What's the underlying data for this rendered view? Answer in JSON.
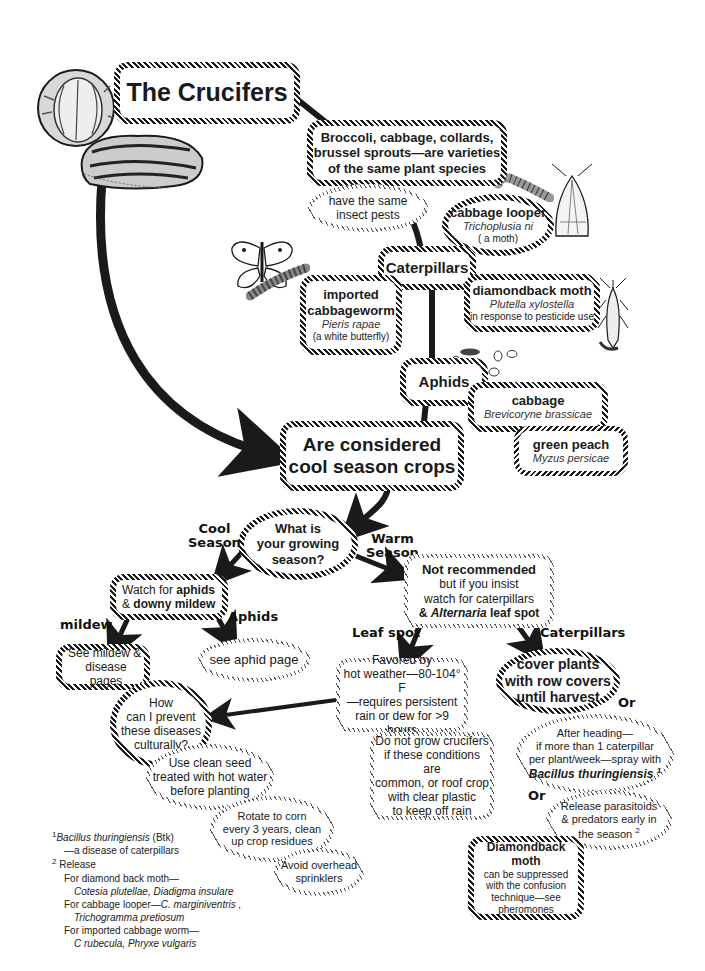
{
  "title": "The Crucifers",
  "nodes": {
    "varieties": "Broccoli, cabbage, collards, brussel sprouts—are varieties of the same plant species",
    "varieties_lines": [
      "Broccoli, cabbage, collards,",
      "brussel sprouts—are varieties",
      "of the same plant species"
    ],
    "same_pests": [
      "have the same",
      "insect pests"
    ],
    "caterpillars": "Caterpillars",
    "cabbage_looper": {
      "name": "cabbage looper",
      "sci": "Trichoplusia ni",
      "note": "( a moth)"
    },
    "imported_cabbageworm": {
      "name_lines": [
        "imported",
        "cabbageworm"
      ],
      "sci": "Pieris rapae",
      "note": "(a white butterfly)"
    },
    "diamondback_moth": {
      "name": "diamondback moth",
      "sci": "Plutella xylostella",
      "note": "in response to pesticide use"
    },
    "aphids": "Aphids",
    "cabbage_aphid": {
      "name": "cabbage",
      "sci": "Brevicoryne brassicae"
    },
    "green_peach": {
      "name": "green peach",
      "sci": "Myzus persicae"
    },
    "cool_season_crops": [
      "Are considered",
      "cool season crops"
    ],
    "growing_season": [
      "What is",
      "your growing",
      "season?"
    ],
    "watch_aphids": {
      "prefix1": "Watch for ",
      "bold1": "aphids",
      "prefix2": "& ",
      "bold2": "downy mildew"
    },
    "not_recommended": {
      "title": "Not recommended",
      "line2": "but if you insist",
      "line3": "watch for caterpillars",
      "prefix4": "& ",
      "ital4": "Alternaria",
      "suffix4": " leaf spot"
    },
    "see_mildew": [
      "See mildew &",
      "disease pages"
    ],
    "see_aphid": "see aphid page",
    "prevent_culturally": [
      "How",
      "can I prevent",
      "these diseases",
      "culturally?"
    ],
    "favored_by": [
      "Favored by",
      "hot weather—80-104° F",
      "—requires persistent",
      "rain or dew for >9 hours"
    ],
    "do_not_grow": [
      "Do not grow crucifers",
      "if these conditions are",
      "common, or roof crop",
      "with clear plastic",
      "to keep off rain"
    ],
    "cover_plants": [
      "cover plants",
      "with row covers",
      "until harvest"
    ],
    "after_heading": {
      "lines": [
        "After heading—",
        "if more than 1 caterpillar",
        "per plant/week—spray with"
      ],
      "bold_ital": "Bacillus thuringiensis",
      "sup": "1"
    },
    "release_parasitoids": {
      "lines": [
        "Release parasitoids",
        "& predators early in",
        "the season"
      ],
      "sup": "2"
    },
    "diamondback_confusion": {
      "title": "Diamondback moth",
      "lines": [
        "can be suppressed",
        "with the confusion",
        "technique—see",
        "pheromones"
      ]
    },
    "clean_seed": [
      "Use clean seed",
      "treated with hot water",
      "before planting"
    ],
    "rotate_corn": [
      "Rotate  to corn",
      "every 3 years, clean",
      "up crop residues"
    ],
    "avoid_overhead": [
      "Avoid overhead",
      "sprinklers"
    ]
  },
  "edge_labels": {
    "cool_season": [
      "Cool",
      "Season"
    ],
    "warm_season": [
      "Warm",
      "Season"
    ],
    "mildew": "mildew",
    "aphids": "Aphids",
    "leaf_spot": "Leaf spot",
    "caterpillars": "Caterpillars",
    "or1": "Or",
    "or2": "Or"
  },
  "footnotes": {
    "fn1": {
      "sup": "1",
      "ital": "Bacillus thuringiensis",
      "rest": " (Btk)",
      "line2": "—a disease of caterpillars"
    },
    "fn2": {
      "sup": "2",
      "title": "Release",
      "items": [
        {
          "label": "For diamond back moth—",
          "species": "Cotesia plutellae,  Diadigma insulare"
        },
        {
          "label": "For cabbage looper—",
          "species_inline": "C. marginiventris ,",
          "species": "Trichogramma pretiosum"
        },
        {
          "label": "For imported cabbage worm—",
          "species": "C rubecula,  Phryxe vulgaris"
        }
      ]
    }
  },
  "illustrations": [
    "cabbage-head-icon",
    "chinese-cabbage-icon",
    "white-butterfly-icon",
    "cabbageworm-larva-icon",
    "looper-caterpillar-icon",
    "looper-moth-icon",
    "diamondback-moth-icon",
    "aphid-cluster-icon"
  ],
  "colors": {
    "ink": "#1a1a1a",
    "background": "#ffffff"
  }
}
